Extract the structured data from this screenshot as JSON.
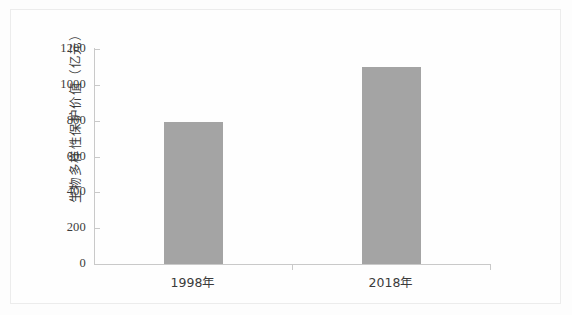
{
  "chart_data": {
    "type": "bar",
    "title": "",
    "subtitle": "",
    "xlabel": "",
    "ylabel": "生物多样性保护价值（亿元）",
    "categories": [
      "1998年",
      "2018年"
    ],
    "values": [
      790,
      1100
    ],
    "series": [
      {
        "name": "生物多样性保护价值",
        "values": [
          790,
          1100
        ]
      }
    ],
    "ylim": [
      0,
      1200
    ],
    "yticks": [
      0,
      200,
      400,
      600,
      800,
      1000,
      1200
    ],
    "ytick_labels": [
      "0",
      "200",
      "400",
      "600",
      "800",
      "1000",
      "1200"
    ],
    "xtick_labels": [
      "1998年",
      "2018年"
    ],
    "grid": false,
    "legend": false,
    "legend_position": "none",
    "bar_color": "#a4a4a4",
    "axis_color": "#c9c9c9",
    "background_color": "#fefefe",
    "annotations": []
  },
  "axis": {
    "y_title": "生物多样性保护价值（亿元）",
    "ticks": [
      {
        "label": "1200",
        "value": 1200
      },
      {
        "label": "1000",
        "value": 1000
      },
      {
        "label": "800",
        "value": 800
      },
      {
        "label": "600",
        "value": 600
      },
      {
        "label": "400",
        "value": 400
      },
      {
        "label": "200",
        "value": 200
      },
      {
        "label": "0",
        "value": 0
      }
    ]
  },
  "bars": [
    {
      "label": "1998年",
      "value": 790
    },
    {
      "label": "2018年",
      "value": 1100
    }
  ]
}
